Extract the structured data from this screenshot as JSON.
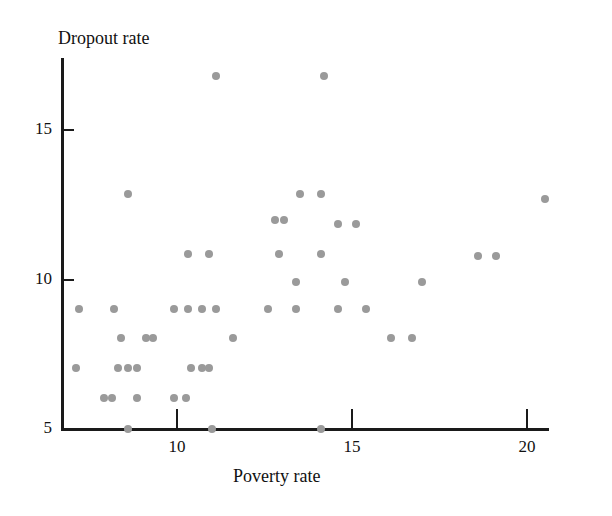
{
  "chart": {
    "y_axis_title": "Dropout rate",
    "x_axis_title": "Poverty rate",
    "x_ticks": [
      "10",
      "15",
      "20"
    ],
    "y_ticks": [
      "15",
      "10",
      "5"
    ]
  },
  "chart_data": {
    "type": "scatter",
    "title": "",
    "xlabel": "Poverty rate",
    "ylabel": "Dropout rate",
    "xlim": [
      6.6,
      21.6
    ],
    "ylim": [
      5.0,
      17.4
    ],
    "x_ticks": [
      10,
      15,
      20
    ],
    "y_ticks": [
      5,
      10,
      15
    ],
    "grid": false,
    "legend": null,
    "marker_color": "#9a9a9a",
    "points": [
      {
        "x": 11.1,
        "y": 16.8
      },
      {
        "x": 14.2,
        "y": 16.8
      },
      {
        "x": 8.6,
        "y": 12.85
      },
      {
        "x": 13.5,
        "y": 12.85
      },
      {
        "x": 14.1,
        "y": 12.85
      },
      {
        "x": 20.5,
        "y": 12.7
      },
      {
        "x": 12.8,
        "y": 12.0
      },
      {
        "x": 13.05,
        "y": 12.0
      },
      {
        "x": 14.6,
        "y": 11.85
      },
      {
        "x": 15.1,
        "y": 11.85
      },
      {
        "x": 10.3,
        "y": 10.85
      },
      {
        "x": 10.9,
        "y": 10.85
      },
      {
        "x": 12.9,
        "y": 10.85
      },
      {
        "x": 14.1,
        "y": 10.85
      },
      {
        "x": 18.6,
        "y": 10.8
      },
      {
        "x": 19.1,
        "y": 10.8
      },
      {
        "x": 13.4,
        "y": 9.9
      },
      {
        "x": 14.8,
        "y": 9.9
      },
      {
        "x": 17.0,
        "y": 9.9
      },
      {
        "x": 7.2,
        "y": 9.0
      },
      {
        "x": 8.2,
        "y": 9.0
      },
      {
        "x": 9.9,
        "y": 9.0
      },
      {
        "x": 10.3,
        "y": 9.0
      },
      {
        "x": 10.7,
        "y": 9.0
      },
      {
        "x": 11.1,
        "y": 9.0
      },
      {
        "x": 12.6,
        "y": 9.0
      },
      {
        "x": 13.4,
        "y": 9.0
      },
      {
        "x": 14.6,
        "y": 9.0
      },
      {
        "x": 15.4,
        "y": 9.0
      },
      {
        "x": 8.4,
        "y": 8.05
      },
      {
        "x": 9.1,
        "y": 8.05
      },
      {
        "x": 9.3,
        "y": 8.05
      },
      {
        "x": 11.6,
        "y": 8.05
      },
      {
        "x": 16.1,
        "y": 8.05
      },
      {
        "x": 16.7,
        "y": 8.05
      },
      {
        "x": 7.1,
        "y": 7.05
      },
      {
        "x": 8.3,
        "y": 7.05
      },
      {
        "x": 8.6,
        "y": 7.05
      },
      {
        "x": 8.85,
        "y": 7.05
      },
      {
        "x": 10.4,
        "y": 7.05
      },
      {
        "x": 10.7,
        "y": 7.05
      },
      {
        "x": 10.9,
        "y": 7.05
      },
      {
        "x": 7.9,
        "y": 6.05
      },
      {
        "x": 8.15,
        "y": 6.05
      },
      {
        "x": 8.85,
        "y": 6.05
      },
      {
        "x": 9.9,
        "y": 6.05
      },
      {
        "x": 10.25,
        "y": 6.05
      },
      {
        "x": 8.6,
        "y": 5.0
      },
      {
        "x": 11.0,
        "y": 5.0
      },
      {
        "x": 14.1,
        "y": 5.0
      }
    ]
  }
}
